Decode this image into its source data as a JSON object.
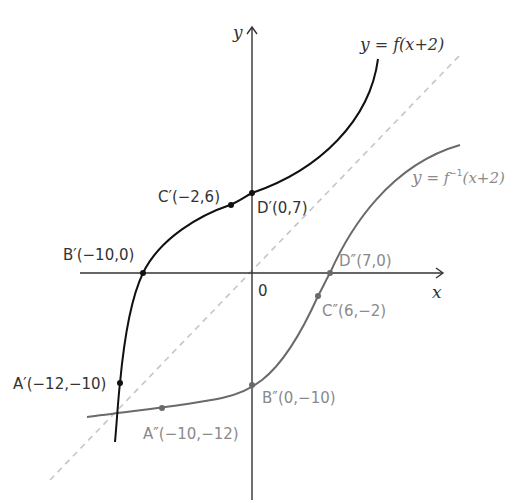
{
  "diagram": {
    "type": "function-graph",
    "axes": {
      "x_label": "x",
      "y_label": "y",
      "origin_label": "0"
    },
    "curves": [
      {
        "name": "y = f(x+2)",
        "label": "y = f(x+2)",
        "color": "#111111",
        "points": [
          {
            "id": "A'",
            "label": "A′(−12,−10)",
            "x": -12,
            "y": -10
          },
          {
            "id": "B'",
            "label": "B′(−10,0)",
            "x": -10,
            "y": 0
          },
          {
            "id": "C'",
            "label": "C′(−2,6)",
            "x": -2,
            "y": 6
          },
          {
            "id": "D'",
            "label": "D′(0,7)",
            "x": 0,
            "y": 7
          }
        ]
      },
      {
        "name": "y = f^-1(x+2)",
        "label": "y = f⁻¹(x+2)",
        "color": "#6e6e6e",
        "points": [
          {
            "id": "A''",
            "label": "A″(−10,−12)",
            "x": -10,
            "y": -12
          },
          {
            "id": "B''",
            "label": "B″(0,−10)",
            "x": 0,
            "y": -10
          },
          {
            "id": "C''",
            "label": "C″(6,−2)",
            "x": 6,
            "y": -2
          },
          {
            "id": "D''",
            "label": "D″(7,0)",
            "x": 7,
            "y": 0
          }
        ]
      }
    ],
    "mirror_line": {
      "equation": "y = x",
      "style": "dashed",
      "color": "#c8c8c8"
    }
  },
  "labels": {
    "y_axis": "y",
    "x_axis": "x",
    "origin": "0",
    "f_curve_y": "y",
    "f_curve_eq": " = f(x+2)",
    "finv_curve_y": "y",
    "finv_curve_eq": " = f",
    "finv_sup": "−1",
    "finv_arg": "(x+2)",
    "A1": "A′(−12,−10)",
    "B1": "B′(−10,0)",
    "C1": "C′(−2,6)",
    "D1": "D′(0,7)",
    "A2": "A″(−10,−12)",
    "B2": "B″(0,−10)",
    "C2": "C″(6,−2)",
    "D2": "D″(7,0)"
  }
}
